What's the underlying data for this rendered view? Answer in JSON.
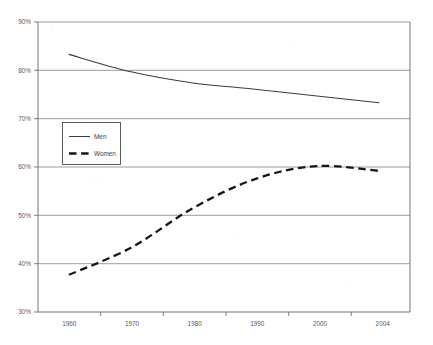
{
  "chart_data": {
    "type": "line",
    "title": "",
    "subtitle": "",
    "xlabel": "",
    "ylabel": "",
    "x": [
      1960,
      1970,
      1980,
      1990,
      2000,
      2004
    ],
    "categories": [
      "1960",
      "1970",
      "1980",
      "1990",
      "2000",
      "2004"
    ],
    "xlim": [
      1960,
      2004
    ],
    "ylim": [
      30,
      90
    ],
    "yticks": [
      30,
      40,
      50,
      60,
      70,
      80,
      90
    ],
    "ytick_labels": [
      "30%",
      "40%",
      "50%",
      "60%",
      "70%",
      "80%",
      "90%"
    ],
    "xtick_labels": [
      "1960",
      "1970",
      "1980",
      "1990",
      "2000",
      "2004"
    ],
    "grid": "horizontal",
    "legend_position": "upper-left-inside",
    "series": [
      {
        "name": "Men",
        "style": "solid",
        "color": "#3c3c40",
        "values": [
          83.3,
          79.7,
          77.4,
          76.1,
          74.7,
          73.3
        ]
      },
      {
        "name": "Women",
        "style": "dashed",
        "color": "#15151a",
        "values": [
          37.7,
          43.3,
          51.5,
          57.5,
          60.2,
          59.2
        ]
      }
    ],
    "annotations": []
  },
  "legend": {
    "entries": [
      {
        "label": "Men",
        "style": "solid"
      },
      {
        "label": "Women",
        "style": "dashed"
      }
    ]
  },
  "axes": {
    "y_labels": [
      "90%",
      "80%",
      "70%",
      "60%",
      "50%",
      "40%",
      "30%"
    ],
    "x_labels": [
      "1960",
      "1970",
      "1980",
      "1990",
      "2000",
      "2004"
    ]
  }
}
